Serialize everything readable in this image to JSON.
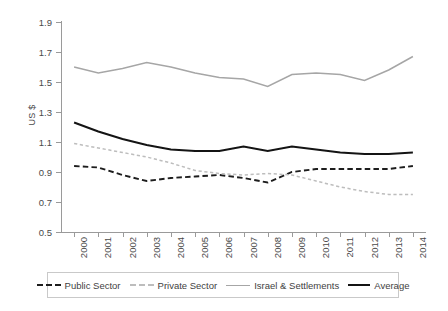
{
  "chart_data": {
    "type": "line",
    "title": "",
    "xlabel": "",
    "ylabel": "US $",
    "ylim": [
      0.5,
      1.9
    ],
    "ytick_values": [
      1.9,
      1.7,
      1.5,
      1.3,
      1.1,
      0.9,
      0.7,
      0.5
    ],
    "ytick_labels": [
      "1.9",
      "1.7",
      "1.5",
      "1.3",
      "1.1",
      "0.9",
      "0.7",
      "0.5"
    ],
    "categories": [
      "2000",
      "2001",
      "2002",
      "2003",
      "2004",
      "2005",
      "2006",
      "2007",
      "2008",
      "2009",
      "2010",
      "2011",
      "2012",
      "2013",
      "2014"
    ],
    "grid": false,
    "legend_position": "bottom",
    "series": [
      {
        "name": "Public Sector",
        "style": "dashed",
        "color": "#1d1d1d",
        "values": [
          0.94,
          0.93,
          0.88,
          0.84,
          0.86,
          0.87,
          0.88,
          0.86,
          0.83,
          0.9,
          0.92,
          0.92,
          0.92,
          0.92,
          0.94
        ]
      },
      {
        "name": "Private Sector",
        "style": "dashed",
        "color": "#bdbdbd",
        "values": [
          1.09,
          1.06,
          1.03,
          1.0,
          0.96,
          0.91,
          0.89,
          0.88,
          0.89,
          0.88,
          0.84,
          0.8,
          0.77,
          0.75,
          0.75
        ]
      },
      {
        "name": "Israel & Settlements",
        "style": "solid",
        "color": "#a6a6a6",
        "values": [
          1.6,
          1.56,
          1.59,
          1.63,
          1.6,
          1.56,
          1.53,
          1.52,
          1.47,
          1.55,
          1.56,
          1.55,
          1.51,
          1.58,
          1.67
        ]
      },
      {
        "name": "Average",
        "style": "solid",
        "color": "#141414",
        "values": [
          1.23,
          1.17,
          1.12,
          1.08,
          1.05,
          1.04,
          1.04,
          1.07,
          1.04,
          1.07,
          1.05,
          1.03,
          1.02,
          1.02,
          1.03
        ]
      }
    ]
  },
  "axis": {
    "y_title": "US $"
  },
  "legend": {
    "items": [
      {
        "label": "Public Sector"
      },
      {
        "label": "Private Sector"
      },
      {
        "label": "Israel & Settlements"
      },
      {
        "label": "Average"
      }
    ]
  }
}
